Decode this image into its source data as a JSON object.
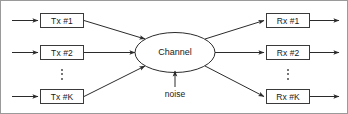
{
  "figure": {
    "stroke_color": "#333333",
    "border_color": "#9a9a9a",
    "background": "#ffffff"
  },
  "transmitters": [
    {
      "label": "Tx #1"
    },
    {
      "label": "Tx #2"
    },
    {
      "label": "Tx #K"
    }
  ],
  "receivers": [
    {
      "label": "Rx #1"
    },
    {
      "label": "Rx #2"
    },
    {
      "label": "Rx #K"
    }
  ],
  "channel": {
    "label": "Channel"
  },
  "noise": {
    "label": "noise"
  },
  "ellipsis": {
    "left": "vertical-dots",
    "right": "vertical-dots"
  }
}
